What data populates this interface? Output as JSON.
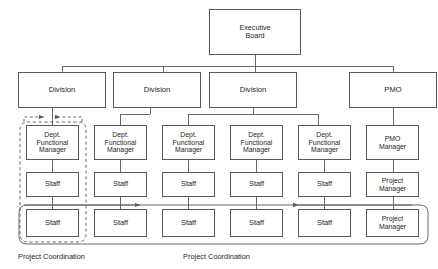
{
  "diagram": {
    "colors": {
      "line": "#58595b",
      "box_border": "#58595b",
      "text": "#231f20",
      "background": "#ffffff"
    },
    "nodes": {
      "executive_board": "Executive\nBoard",
      "division_1": "Division",
      "division_2": "Division",
      "division_3": "Division",
      "pmo": "PMO",
      "dept_manager_1": "Dept.\nFunctional\nManager",
      "dept_manager_2": "Dept.\nFunctional\nManager",
      "dept_manager_3": "Dept.\nFunctional\nManager",
      "dept_manager_4": "Dept.\nFunctional\nManager",
      "dept_manager_5": "Dept.\nFunctional\nManager",
      "pmo_manager": "PMO\nManager",
      "staff_1_1": "Staff",
      "staff_1_2": "Staff",
      "staff_1_3": "Staff",
      "staff_1_4": "Staff",
      "staff_1_5": "Staff",
      "project_manager_1": "Project\nManager",
      "staff_2_1": "Staff",
      "staff_2_2": "Staff",
      "staff_2_3": "Staff",
      "staff_2_4": "Staff",
      "staff_2_5": "Staff",
      "project_manager_2": "Project\nManager"
    },
    "captions": {
      "project_coordination_left": "Project Coordination",
      "project_coordination_right": "Project Coordination"
    }
  }
}
